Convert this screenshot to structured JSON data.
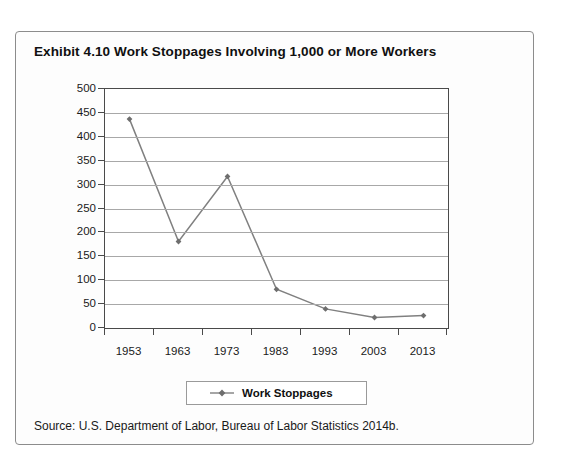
{
  "exhibit": {
    "title": "Exhibit 4.10  Work Stoppages Involving 1,000 or More Workers",
    "source": "Source: U.S. Department of Labor, Bureau of Labor Statistics 2014b."
  },
  "legend": {
    "position": "bottom",
    "entries": [
      {
        "label": "Work Stoppages",
        "color": "#808080",
        "marker": "diamond"
      }
    ]
  },
  "chart_data": {
    "type": "line",
    "title": "Exhibit 4.10  Work Stoppages Involving 1,000 or More Workers",
    "xlabel": "",
    "ylabel": "",
    "categories": [
      "1953",
      "1963",
      "1973",
      "1983",
      "1993",
      "2003",
      "2013"
    ],
    "series": [
      {
        "name": "Work Stoppages",
        "values": [
          437,
          181,
          317,
          81,
          40,
          22,
          26
        ],
        "color": "#808080",
        "marker": "diamond"
      }
    ],
    "ylim": [
      0,
      500
    ],
    "yticks": [
      0,
      50,
      100,
      150,
      200,
      250,
      300,
      350,
      400,
      450,
      500
    ],
    "ytick_labels": [
      "0",
      "50",
      "100",
      "150",
      "200",
      "250",
      "300",
      "350",
      "400",
      "450",
      "500"
    ],
    "grid": true,
    "grid_axis": "y",
    "legend_position": "bottom"
  },
  "style": {
    "grid_color": "#a8a8a8",
    "axis_color": "#4a4a4a",
    "series_color": "#808080",
    "frame_color": "#8c8c8c",
    "text_color": "#1a1a1a",
    "plot_background": "#ffffff"
  }
}
